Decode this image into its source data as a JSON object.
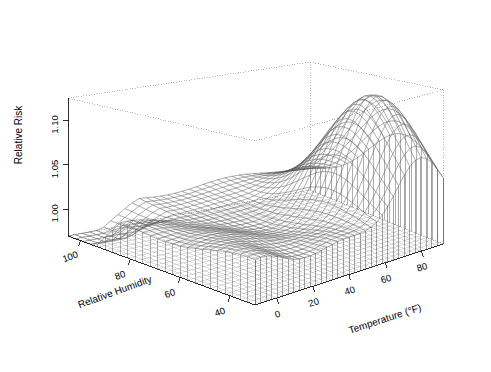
{
  "chart_data": {
    "type": "surface",
    "title": "",
    "projection": "persp-3d-wireframe",
    "background_color": "#ffffff",
    "line_color": "#555555",
    "box_line_color": "#888888",
    "axes": {
      "x": {
        "label": "Temperature (°F)",
        "ticks": [
          0,
          20,
          40,
          60,
          80
        ],
        "tick_labels": [
          "0",
          "20",
          "40",
          "60",
          "80"
        ],
        "range": [
          -12,
          92
        ],
        "units": "°F"
      },
      "y": {
        "label": "Relative Humidity",
        "ticks": [
          40,
          60,
          80,
          100
        ],
        "tick_labels": [
          "40",
          "60",
          "80",
          "100"
        ],
        "range": [
          30,
          105
        ],
        "units": "%"
      },
      "z": {
        "label": "Relative Risk",
        "ticks": [
          1.0,
          1.05,
          1.1
        ],
        "tick_labels": [
          "1.00",
          "1.05",
          "1.10"
        ],
        "range": [
          0.97,
          1.125
        ]
      }
    },
    "grid": true,
    "legend": null,
    "drop_lines": true,
    "x_values": [
      -12,
      -9,
      -6,
      -3,
      0,
      3,
      6,
      9,
      12,
      15,
      18,
      21,
      24,
      27,
      30,
      33,
      36,
      39,
      42,
      45,
      48,
      51,
      54,
      57,
      60,
      63,
      66,
      69,
      72,
      75,
      78,
      81,
      84,
      87,
      90
    ],
    "y_values": [
      30,
      33,
      36,
      39,
      42,
      45,
      48,
      51,
      54,
      57,
      60,
      63,
      66,
      69,
      72,
      75,
      78,
      81,
      84,
      87,
      90,
      93,
      96,
      99,
      102,
      105
    ],
    "z_surface_description": "Relative risk surface: flat near 1.00 at high humidity and low temperature, a shallow valley near 0.995 in mid temperature range, rising steeply to a ridge peak near 1.11 at high temperature (70-85 F) and low-to-mid humidity (40-65%).",
    "z_min": 0.99,
    "z_max": 1.11,
    "z_peak_location": {
      "temperature": 78,
      "relative_humidity": 52,
      "relative_risk": 1.11
    },
    "z_valley_location": {
      "temperature": 30,
      "relative_humidity": 70,
      "relative_risk": 0.995
    }
  },
  "axis_labels": {
    "z_title": "Relative Risk",
    "y_title": "Relative Humidity",
    "x_title": "Temperature (°F)"
  },
  "z_ticks": [
    {
      "label": "1.10",
      "value": 1.1
    },
    {
      "label": "1.05",
      "value": 1.05
    },
    {
      "label": "1.00",
      "value": 1.0
    }
  ],
  "y_ticks": [
    {
      "label": "100",
      "value": 100
    },
    {
      "label": "80",
      "value": 80
    },
    {
      "label": "60",
      "value": 60
    },
    {
      "label": "40",
      "value": 40
    }
  ],
  "x_ticks": [
    {
      "label": "0",
      "value": 0
    },
    {
      "label": "20",
      "value": 20
    },
    {
      "label": "40",
      "value": 40
    },
    {
      "label": "60",
      "value": 60
    },
    {
      "label": "80",
      "value": 80
    }
  ]
}
